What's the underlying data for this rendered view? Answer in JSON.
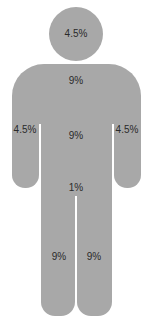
{
  "diagram": {
    "fill_color": "#a8a8a8",
    "text_color": "#2a2a2a",
    "regions": {
      "head": {
        "label": "4.5%",
        "x": 76,
        "y": 34
      },
      "chest": {
        "label": "9%",
        "x": 76,
        "y": 81
      },
      "left_arm": {
        "label": "4.5%",
        "x": 25,
        "y": 130
      },
      "abdomen": {
        "label": "9%",
        "x": 76,
        "y": 136
      },
      "right_arm": {
        "label": "4.5%",
        "x": 127,
        "y": 130
      },
      "groin": {
        "label": "1%",
        "x": 76,
        "y": 188
      },
      "left_leg": {
        "label": "9%",
        "x": 59,
        "y": 257
      },
      "right_leg": {
        "label": "9%",
        "x": 94,
        "y": 257
      }
    }
  }
}
